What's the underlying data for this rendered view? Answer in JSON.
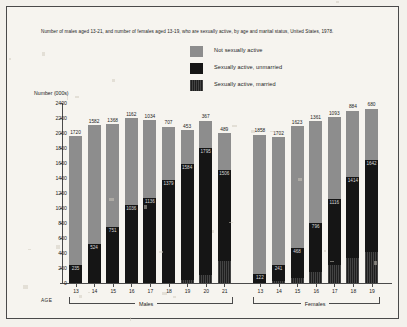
{
  "title": "Number of males aged 13-21, and number of females aged 13-19, who are sexually active, by age and marital status, United States, 1978.",
  "ylabel": "Number (000s)",
  "age_label": "AGE",
  "legend": [
    {
      "label": "Not sexually active",
      "color": "#8d8d8d",
      "key": "not_active"
    },
    {
      "label": "Sexually active, unmarried",
      "color": "#151515",
      "key": "active_unmarried"
    },
    {
      "label": "Sexually active, married",
      "color": "#1e1e1e",
      "key": "active_married"
    }
  ],
  "groups": [
    {
      "name": "Males",
      "key": "males"
    },
    {
      "name": "Females",
      "key": "females"
    }
  ],
  "yticks": [
    "0",
    "200",
    "400",
    "600",
    "800",
    "1000",
    "1200",
    "1400",
    "1600",
    "1800",
    "2000",
    "2200",
    "2400"
  ],
  "chart_data": {
    "type": "bar",
    "subtype": "stacked",
    "title": "Number of males aged 13-21, and number of females aged 13-19, who are sexually active, by age and marital status, United States, 1978.",
    "xlabel": "AGE",
    "ylabel": "Number (000s)",
    "ylim": [
      0,
      2400
    ],
    "ytick_step": 200,
    "grid": false,
    "legend_position": "top-center",
    "series": [
      {
        "name": "Not sexually active",
        "color": "#8d8d8d"
      },
      {
        "name": "Sexually active, unmarried",
        "color": "#151515"
      },
      {
        "name": "Sexually active, married",
        "color": "#1e1e1e"
      }
    ],
    "groups": [
      {
        "name": "Males",
        "categories": [
          "13",
          "14",
          "15",
          "16",
          "17",
          "18",
          "19",
          "20",
          "21"
        ],
        "not_sexually_active": [
          1720,
          1582,
          1368,
          1162,
          1034,
          707,
          453,
          367,
          489
        ],
        "sexually_active_unmarried": [
          235,
          524,
          751,
          1036,
          1136,
          1379,
          1544,
          1685,
          1206
        ],
        "sexually_active_married": [
          0,
          0,
          0,
          0,
          0,
          0,
          40,
          110,
          300
        ]
      },
      {
        "name": "Females",
        "categories": [
          "13",
          "14",
          "15",
          "16",
          "17",
          "18",
          "19"
        ],
        "not_sexually_active": [
          1858,
          1702,
          1623,
          1361,
          1093,
          884,
          680
        ],
        "sexually_active_unmarried": [
          122,
          211,
          398,
          646,
          876,
          1084,
          1222
        ],
        "sexually_active_married": [
          0,
          30,
          70,
          150,
          240,
          330,
          420
        ]
      }
    ]
  }
}
